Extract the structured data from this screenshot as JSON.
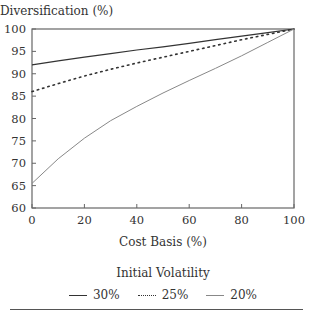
{
  "chart_data": {
    "type": "line",
    "title": "",
    "xlabel": "Cost Basis (%)",
    "ylabel": "Diversification (%)",
    "xlim": [
      0,
      100
    ],
    "ylim": [
      60,
      100
    ],
    "x_ticks": [
      0,
      20,
      40,
      60,
      80,
      100
    ],
    "y_ticks": [
      60,
      65,
      70,
      75,
      80,
      85,
      90,
      95,
      100
    ],
    "grid": false,
    "legend_title": "Initial Volatility",
    "legend_position": "bottom",
    "x": [
      0,
      10,
      20,
      30,
      40,
      50,
      60,
      70,
      80,
      90,
      100
    ],
    "series": [
      {
        "name": "30%",
        "style": "solid",
        "color": "#333333",
        "width": 1.2,
        "values": [
          92,
          92.9,
          93.7,
          94.5,
          95.3,
          96,
          96.8,
          97.6,
          98.4,
          99.2,
          100
        ]
      },
      {
        "name": "25%",
        "style": "dotted",
        "color": "#333333",
        "width": 1.6,
        "values": [
          86,
          87.8,
          89.5,
          91,
          92.4,
          93.7,
          95,
          96.3,
          97.6,
          98.8,
          100
        ]
      },
      {
        "name": "20%",
        "style": "solid",
        "color": "#888888",
        "width": 1,
        "values": [
          65.5,
          71,
          75.6,
          79.5,
          82.7,
          85.7,
          88.5,
          91.2,
          94,
          97,
          100
        ]
      }
    ]
  }
}
